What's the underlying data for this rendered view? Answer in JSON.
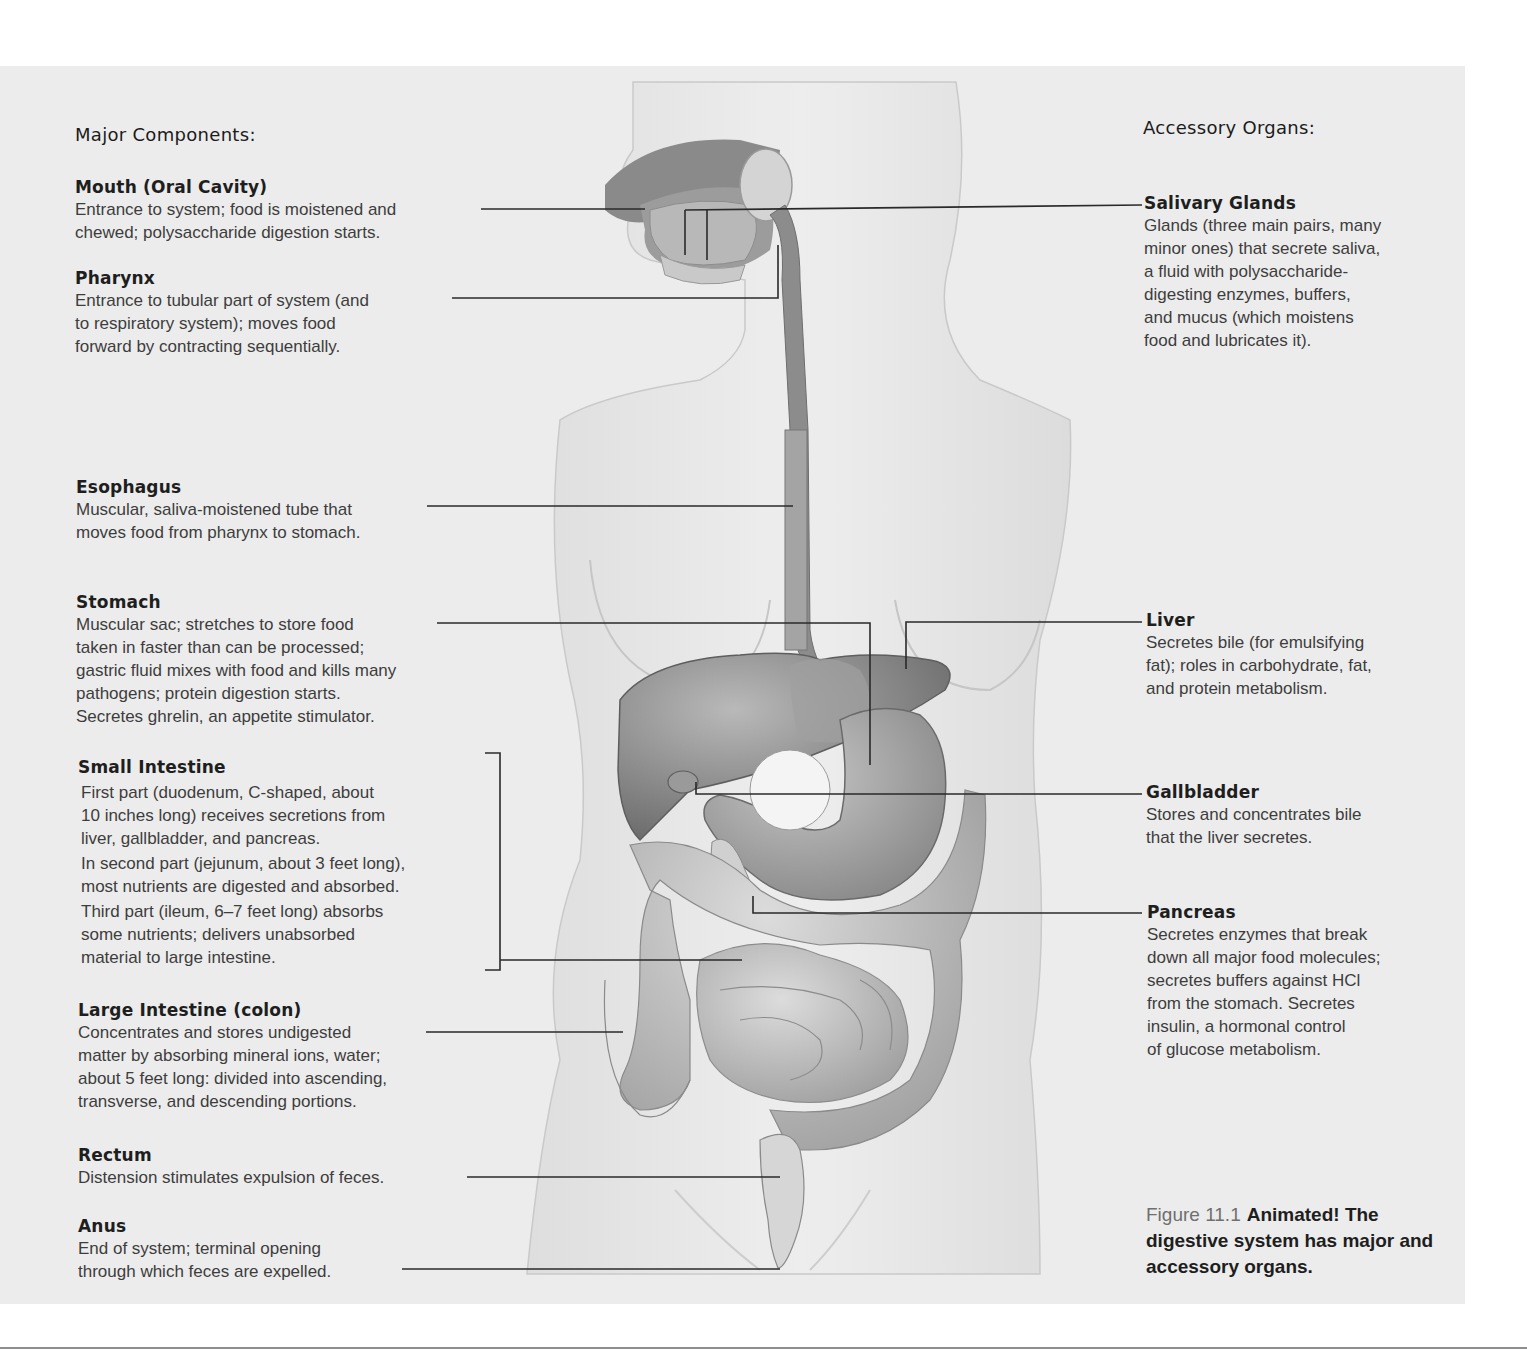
{
  "figure": {
    "number": "Figure 11.1",
    "caption": "Animated! The digestive system has major and accessory organs."
  },
  "major_components": {
    "heading": "Major Components:",
    "items": [
      {
        "term": "Mouth (Oral Cavity)",
        "description": "Entrance to system; food is moistened and\nchewed; polysaccharide digestion starts."
      },
      {
        "term": "Pharynx",
        "description": "Entrance to tubular part of system (and\nto respiratory system); moves food\nforward by contracting sequentially."
      },
      {
        "term": "Esophagus",
        "description": "Muscular, saliva-moistened tube that\nmoves food from pharynx to stomach."
      },
      {
        "term": "Stomach",
        "description": "Muscular sac; stretches to store food\ntaken in faster than can be processed;\ngastric fluid mixes with food and kills many\npathogens; protein digestion starts.\nSecretes ghrelin, an appetite stimulator."
      },
      {
        "term": "Small Intestine",
        "parts": [
          "First part (duodenum, C-shaped, about\n10 inches long) receives secretions from\nliver, gallbladder, and pancreas.",
          "In second part (jejunum, about 3 feet long),\nmost nutrients are digested and absorbed.",
          "Third part (ileum, 6–7 feet long) absorbs\nsome nutrients; delivers unabsorbed\nmaterial to large intestine."
        ]
      },
      {
        "term": "Large Intestine (colon)",
        "description": "Concentrates and stores undigested\nmatter by absorbing mineral ions, water;\nabout 5 feet long: divided into ascending,\ntransverse, and descending portions."
      },
      {
        "term": "Rectum",
        "description": "Distension stimulates expulsion of feces."
      },
      {
        "term": "Anus",
        "description": "End of system; terminal opening\nthrough which feces are expelled."
      }
    ]
  },
  "accessory_organs": {
    "heading": "Accessory Organs:",
    "items": [
      {
        "term": "Salivary Glands",
        "description": "Glands (three main pairs, many\nminor ones) that secrete saliva,\na fluid with polysaccharide-\ndigesting enzymes, buffers,\nand mucus (which moistens\nfood and lubricates it)."
      },
      {
        "term": "Liver",
        "description": "Secretes bile (for emulsifying\nfat); roles in carbohydrate, fat,\nand protein metabolism."
      },
      {
        "term": "Gallbladder",
        "description": "Stores and concentrates bile\nthat the liver secretes."
      },
      {
        "term": "Pancreas",
        "description": "Secretes enzymes that break\ndown all major food molecules;\nsecretes buffers against HCl\nfrom the stomach. Secretes\ninsulin, a hormonal control\nof glucose metabolism."
      }
    ]
  },
  "colors": {
    "panel_bg": "#ececec",
    "page_bg": "#ffffff",
    "leader_line": "#2a2a2a",
    "organ_dark": "#7a7a7a",
    "organ_mid": "#a8a8a8",
    "organ_light": "#cfcfcf",
    "body_silhouette": "#e2e2e2"
  }
}
